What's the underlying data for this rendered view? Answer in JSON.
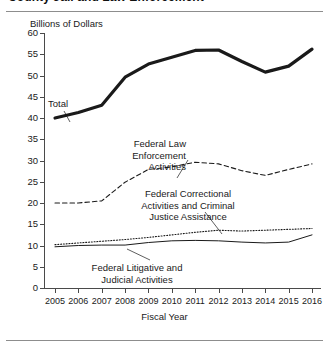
{
  "figure": {
    "title_partial": "County Jail and Law Enforcement",
    "y_axis_unit": "Billions of Dollars",
    "x_axis_title": "Fiscal Year"
  },
  "chart_data": {
    "type": "line",
    "title": "Billions of Dollars",
    "xlabel": "Fiscal Year",
    "ylabel": "Billions of Dollars",
    "categories": [
      "2005",
      "2006",
      "2007",
      "2008",
      "2009",
      "2010",
      "2011",
      "2012",
      "2013",
      "2014",
      "2015",
      "2016"
    ],
    "ylim": [
      0,
      60
    ],
    "yticks": [
      0,
      5,
      10,
      15,
      20,
      25,
      30,
      35,
      40,
      45,
      50,
      55,
      60
    ],
    "grid": false,
    "legend": "inline-annotations",
    "series": [
      {
        "name": "Total",
        "style": "solid-thick",
        "values": [
          40.0,
          41.3,
          43.0,
          49.6,
          52.7,
          54.3,
          55.9,
          56.0,
          53.3,
          50.8,
          52.2,
          56.2
        ]
      },
      {
        "name": "Federal Law Enforcement Activities",
        "style": "dashed",
        "values": [
          20.0,
          20.0,
          20.5,
          24.9,
          27.9,
          28.5,
          29.6,
          29.2,
          27.6,
          26.5,
          27.9,
          29.2
        ]
      },
      {
        "name": "Federal Correctional Activities and Criminal Justice Assistance",
        "style": "dotted",
        "values": [
          10.2,
          10.6,
          11.0,
          11.4,
          11.9,
          12.5,
          13.1,
          13.6,
          13.4,
          13.6,
          13.8,
          14.0
        ]
      },
      {
        "name": "Federal Litigative and Judicial Activities",
        "style": "solid-thin",
        "values": [
          9.7,
          10.0,
          10.1,
          10.1,
          10.7,
          11.1,
          11.2,
          11.1,
          10.8,
          10.6,
          10.8,
          12.5
        ]
      }
    ]
  },
  "annotations": {
    "total": "Total",
    "federal_law_enforcement": "Federal Law\nEnforcement\nActivities",
    "federal_correctional": "Federal Correctional\nActivities and Criminal\nJustice Assistance",
    "federal_litigative": "Federal Litigative and\nJudicial Activities"
  },
  "colors": {
    "ink": "#1a1a1a",
    "axis": "#4a4a4a",
    "rule": "#8d8d8d",
    "background": "#ffffff"
  }
}
